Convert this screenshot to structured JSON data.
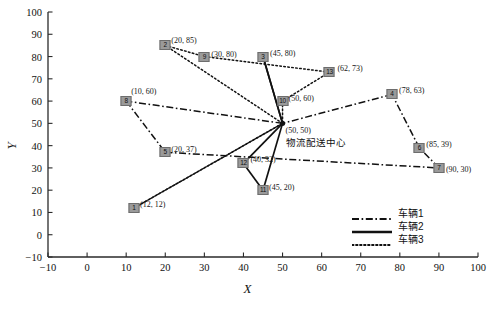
{
  "chart_data": {
    "type": "scatter",
    "title": "",
    "xlabel": "X",
    "ylabel": "Y",
    "xlim": [
      -10,
      100
    ],
    "ylim": [
      -10,
      100
    ],
    "xticks": [
      "-10",
      "0",
      "10",
      "20",
      "30",
      "40",
      "50",
      "60",
      "70",
      "80",
      "90",
      "100"
    ],
    "yticks": [
      "-10",
      "0",
      "10",
      "20",
      "30",
      "40",
      "50",
      "60",
      "70",
      "80",
      "90",
      "100"
    ],
    "grid": false,
    "legend_position": "lower-right",
    "depot": {
      "id": "0",
      "x": 50,
      "y": 50,
      "coord_label": "(50, 50)",
      "name": "物流配送中心"
    },
    "nodes": [
      {
        "id": "1",
        "x": 12,
        "y": 12,
        "label": "(12, 12)"
      },
      {
        "id": "2",
        "x": 20,
        "y": 85,
        "label": "(20, 85)"
      },
      {
        "id": "3",
        "x": 45,
        "y": 80,
        "label": "(45, 80)"
      },
      {
        "id": "4",
        "x": 78,
        "y": 63,
        "label": "(78, 63)"
      },
      {
        "id": "5",
        "x": 20,
        "y": 37,
        "label": "(20, 37)"
      },
      {
        "id": "6",
        "x": 85,
        "y": 39,
        "label": "(85, 39)"
      },
      {
        "id": "7",
        "x": 90,
        "y": 30,
        "label": "(90, 30)"
      },
      {
        "id": "8",
        "x": 10,
        "y": 60,
        "label": "(10, 60)"
      },
      {
        "id": "9",
        "x": 30,
        "y": 80,
        "label": "(30, 80)"
      },
      {
        "id": "10",
        "x": 50,
        "y": 60,
        "label": "(50, 60)"
      },
      {
        "id": "11",
        "x": 45,
        "y": 20,
        "label": "(45, 20)"
      },
      {
        "id": "12",
        "x": 40,
        "y": 32,
        "label": "(40, 32)"
      },
      {
        "id": "13",
        "x": 62,
        "y": 73,
        "label": "(62, 73)"
      }
    ],
    "series": [
      {
        "name": "车辆1",
        "style": "dashdot",
        "route": [
          "0",
          "8",
          "5",
          "7",
          "6",
          "4",
          "0"
        ]
      },
      {
        "name": "车辆2",
        "style": "solid",
        "route": [
          "0",
          "3",
          "0",
          "12",
          "11",
          "0"
        ]
      },
      {
        "name": "车辆3",
        "style": "dotted",
        "route": [
          "0",
          "2",
          "9",
          "13",
          "10",
          "0",
          "1",
          "0"
        ]
      }
    ]
  },
  "legend": {
    "items": [
      {
        "label": "车辆1",
        "style": "dashdot"
      },
      {
        "label": "车辆2",
        "style": "solid"
      },
      {
        "label": "车辆3",
        "style": "dotted"
      }
    ]
  },
  "axes": {
    "x_title": "X",
    "y_title": "Y"
  },
  "colors": {
    "line": "#111111",
    "node_fill": "#9a9a9a",
    "axis": "#2a2a2a",
    "text": "#111111"
  }
}
